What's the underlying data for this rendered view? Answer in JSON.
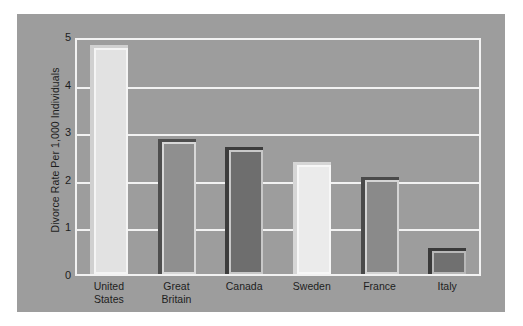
{
  "chart_data": {
    "type": "bar",
    "title": "",
    "xlabel": "",
    "ylabel": "Divorce Rate Per 1,000 Individuals",
    "categories": [
      "United States",
      "Great Britain",
      "Canada",
      "Sweden",
      "France",
      "Italy"
    ],
    "values": [
      4.75,
      2.78,
      2.6,
      2.28,
      1.97,
      0.49
    ],
    "ylim": [
      0,
      5
    ],
    "yticks": [
      "0",
      "1",
      "2",
      "3",
      "4",
      "5"
    ],
    "ytick_values": [
      0,
      1,
      2,
      3,
      4,
      5
    ],
    "grid": true,
    "legend": "none",
    "bar_colors": [
      "#e2e2e2",
      "#8f8f8f",
      "#6e6e6e",
      "#ebebeb",
      "#8a8a8a",
      "#707070"
    ],
    "bar_shadow_colors": [
      "#d0d0d0",
      "#4e4e4e",
      "#3c3c3c",
      "#d6d6d6",
      "#4a4a4a",
      "#3a3a3a"
    ],
    "bar_highlight_colors": [
      "#f4f4f4",
      "#d8d8d8",
      "#c8c8c8",
      "#f7f7f7",
      "#d4d4d4",
      "#b8b8b8"
    ]
  },
  "style": {
    "page_background": "#ffffff",
    "figure_background": "#9d9d9d",
    "plot_background": "#9d9d9d",
    "gridline_color": "#f2f2f2",
    "axis_color": "#f2f2f2",
    "text_color": "#1d1d1d"
  }
}
